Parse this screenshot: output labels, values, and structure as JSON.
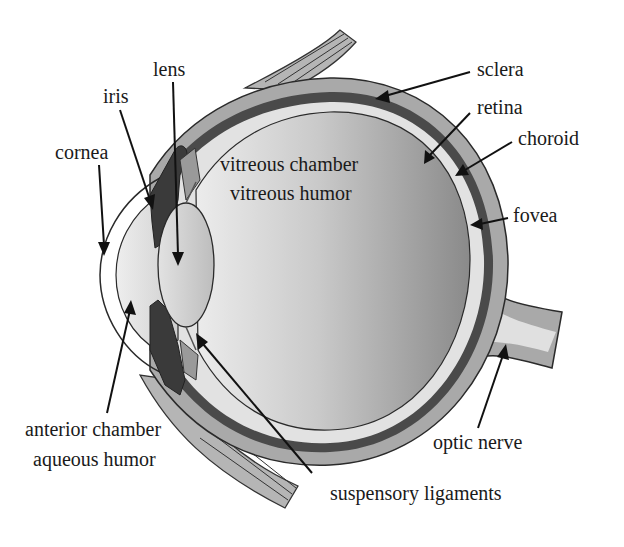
{
  "figure": {
    "colors": {
      "background": "#ffffff",
      "sclera": "#a9a9a9",
      "choroid": "#4a4a4a",
      "retina": "#dcdcdc",
      "vitreous_dark": "#8f8f8f",
      "vitreous_light": "#e4e4e4",
      "lens": "#d2d2d2",
      "aqueous": "#dedede",
      "iris": "#3a3a3a",
      "outline": "#2a2a2a",
      "text": "#1a1a1a"
    },
    "labels": {
      "lens": "lens",
      "iris": "iris",
      "cornea": "cornea",
      "sclera": "sclera",
      "retina": "retina",
      "choroid": "choroid",
      "fovea": "fovea",
      "vitreous_chamber": "vitreous chamber",
      "vitreous_humor": "vitreous humor",
      "anterior_chamber": "anterior chamber",
      "aqueous_humor": "aqueous humor",
      "suspensory_ligaments": "suspensory ligaments",
      "optic_nerve": "optic nerve"
    }
  }
}
